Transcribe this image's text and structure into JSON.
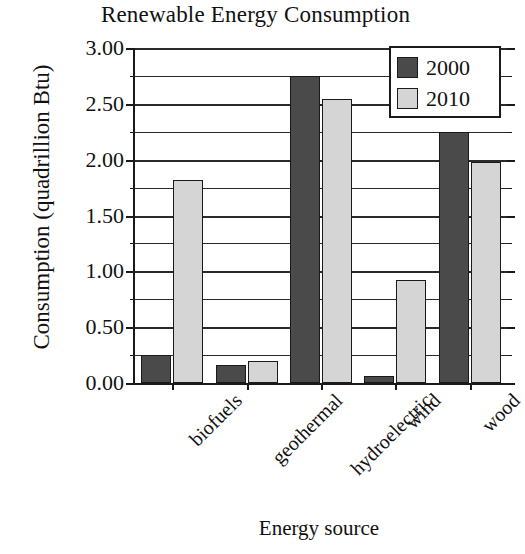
{
  "chart_data": {
    "type": "bar",
    "title": "Renewable Energy Consumption",
    "xlabel": "Energy source",
    "ylabel": "Consumption (quadrillion Btu)",
    "categories": [
      "biofuels",
      "geothermal",
      "hydroelectric",
      "wind",
      "wood"
    ],
    "series": [
      {
        "name": "2000",
        "color": "#4a4a4a",
        "values": [
          0.25,
          0.16,
          2.75,
          0.06,
          2.25
        ]
      },
      {
        "name": "2010",
        "color": "#d5d5d5",
        "values": [
          1.82,
          0.2,
          2.54,
          0.92,
          1.98
        ]
      }
    ],
    "ylim": [
      0.0,
      3.0
    ],
    "ytick_labels": [
      "0.00",
      "0.50",
      "1.00",
      "1.50",
      "2.00",
      "2.50",
      "3.00"
    ],
    "ytick_values": [
      0.0,
      0.5,
      1.0,
      1.5,
      2.0,
      2.5,
      3.0
    ],
    "yminor_values": [
      0.25,
      0.75,
      1.25,
      1.75,
      2.25,
      2.75
    ],
    "grid": true,
    "grid_axis": "y",
    "legend_position": "upper right",
    "legend_entries": [
      "2000",
      "2010"
    ],
    "background": "#ffffff",
    "axis_color": "#1a1a1a"
  }
}
